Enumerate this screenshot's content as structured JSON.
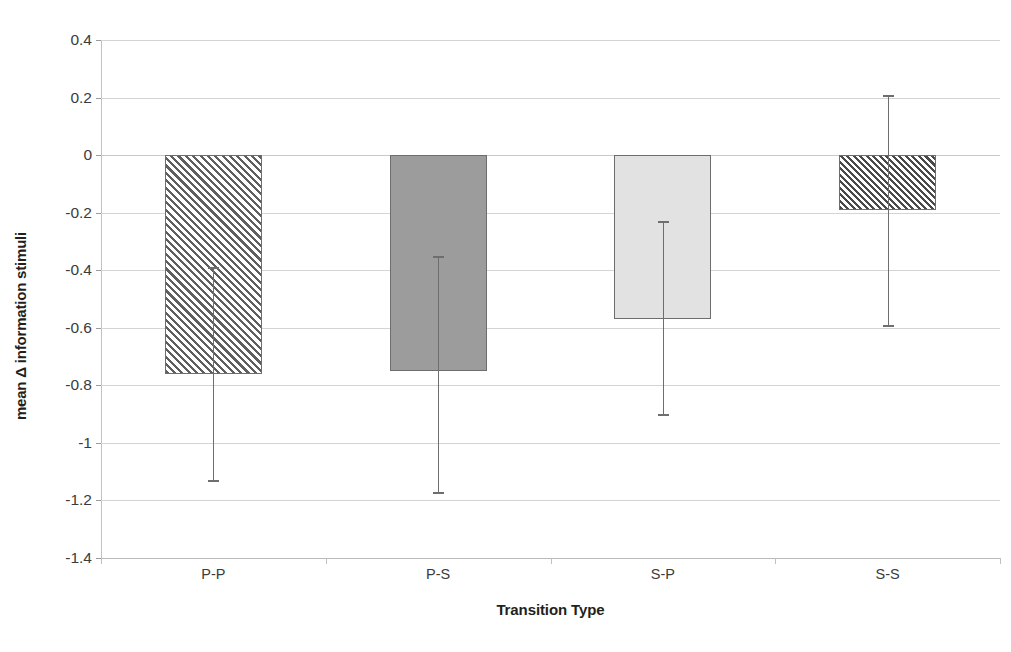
{
  "chart_data": {
    "type": "bar",
    "title": "",
    "xlabel": "Transition Type",
    "ylabel": "mean Δ information stimuli",
    "categories": [
      "P-P",
      "P-S",
      "S-P",
      "S-S"
    ],
    "values": [
      -0.76,
      -0.75,
      -0.57,
      -0.19
    ],
    "error_low": [
      -1.13,
      -1.17,
      -0.9,
      -0.59
    ],
    "error_high": [
      -0.39,
      -0.35,
      -0.23,
      0.21
    ],
    "ylim": [
      -1.4,
      0.4
    ],
    "ytick_labels": [
      "0.4",
      "0.2",
      "0",
      "-0.2",
      "-0.4",
      "-0.6",
      "-0.8",
      "-1",
      "-1.2",
      "-1.4"
    ],
    "ytick_values": [
      0.4,
      0.2,
      0,
      -0.2,
      -0.4,
      -0.6,
      -0.8,
      -1,
      -1.2,
      -1.4
    ],
    "grid": true,
    "legend": "none",
    "bar_fills": [
      "hatch-sparse",
      "solid-mid",
      "solid-light",
      "hatch-dense"
    ],
    "colors": {
      "gridline": "#d4d4d4",
      "axis": "#b9b9b9",
      "bar_outline": "#6d6d6d",
      "errorbar": "#6e6e6e",
      "solid_mid": "#9c9c9c",
      "solid_light": "#e2e2e2",
      "hatch_line": "#5f5f5f",
      "text": "#231f20"
    }
  }
}
